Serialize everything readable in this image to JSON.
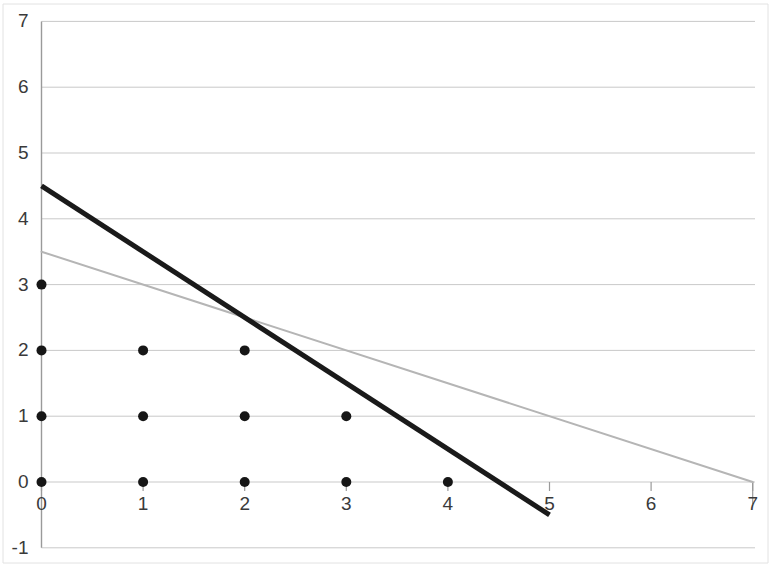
{
  "chart_data": {
    "type": "scatter",
    "title": "",
    "xlabel": "",
    "ylabel": "",
    "xlim": [
      0,
      7
    ],
    "ylim": [
      -1,
      7
    ],
    "x_ticks": [
      0,
      1,
      2,
      3,
      4,
      5,
      6,
      7
    ],
    "y_ticks": [
      -1,
      0,
      1,
      2,
      3,
      4,
      5,
      6,
      7
    ],
    "x_tick_labels": [
      "0",
      "1",
      "2",
      "3",
      "4",
      "5",
      "6",
      "7"
    ],
    "y_tick_labels": [
      "-1",
      "0",
      "1",
      "2",
      "3",
      "4",
      "5",
      "6",
      "7"
    ],
    "grid": "horizontal",
    "legend": "none",
    "series": [
      {
        "name": "lattice-points",
        "type": "scatter",
        "marker": "filled-circle",
        "color": "#161616",
        "marker_size": 9,
        "points": [
          {
            "x": 0,
            "y": 0
          },
          {
            "x": 1,
            "y": 0
          },
          {
            "x": 2,
            "y": 0
          },
          {
            "x": 3,
            "y": 0
          },
          {
            "x": 4,
            "y": 0
          },
          {
            "x": 0,
            "y": 1
          },
          {
            "x": 1,
            "y": 1
          },
          {
            "x": 2,
            "y": 1
          },
          {
            "x": 3,
            "y": 1
          },
          {
            "x": 0,
            "y": 2
          },
          {
            "x": 1,
            "y": 2
          },
          {
            "x": 2,
            "y": 2
          },
          {
            "x": 0,
            "y": 3
          }
        ]
      },
      {
        "name": "constraint-line-dark",
        "type": "line",
        "color": "#1a1a1a",
        "width": 5,
        "equation": "y = 4.5 - x",
        "slope": -1,
        "intercept": 4.5,
        "points": [
          {
            "x": 0,
            "y": 4.5
          },
          {
            "x": 5,
            "y": -0.5
          }
        ]
      },
      {
        "name": "constraint-line-light",
        "type": "line",
        "color": "#b5b5b5",
        "width": 2,
        "equation": "y = 3.5 - 0.5x",
        "slope": -0.5,
        "intercept": 3.5,
        "points": [
          {
            "x": 0,
            "y": 3.5
          },
          {
            "x": 7,
            "y": 0
          }
        ]
      }
    ],
    "intersection": {
      "x": 2,
      "y": 2.5
    },
    "grid_color": "#c9c9c9",
    "axis_color": "#9a9a9a",
    "border_color": "#e2e2e2",
    "background": "#ffffff"
  }
}
